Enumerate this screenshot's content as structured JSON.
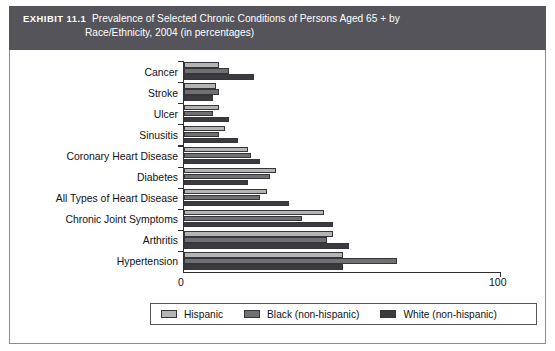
{
  "exhibit": {
    "label": "EXHIBIT 11.1",
    "title_line1": "Prevalence of Selected Chronic Conditions of Persons Aged 65 + by",
    "title_line2": "Race/Ethnicity, 2004 (in percentages)",
    "banner_color": "#55545a"
  },
  "axis": {
    "min_label": "0",
    "max_label": "100",
    "min": 0,
    "max": 100
  },
  "legend": {
    "position": "bottom",
    "entries": [
      {
        "label": "Hispanic",
        "color": "#b4b4b4"
      },
      {
        "label": "Black (non-hispanic)",
        "color": "#6f6f74"
      },
      {
        "label": "White (non-hispanic)",
        "color": "#3a3a40"
      }
    ]
  },
  "chart_data": {
    "type": "bar",
    "orientation": "horizontal",
    "title": "Prevalence of Selected Chronic Conditions of Persons Aged 65 + by Race/Ethnicity, 2004 (in percentages)",
    "xlabel": "",
    "ylabel": "",
    "xlim": [
      0,
      100
    ],
    "grid": false,
    "legend_position": "bottom",
    "categories": [
      "Cancer",
      "Stroke",
      "Ulcer",
      "Sinusitis",
      "Coronary Heart Disease",
      "Diabetes",
      "All Types of Heart Disease",
      "Chronic Joint Symptoms",
      "Arthritis",
      "Hypertension"
    ],
    "series": [
      {
        "name": "Hispanic",
        "color": "#b4b4b4",
        "values": [
          11,
          10,
          11,
          13,
          20,
          29,
          26,
          44,
          47,
          50
        ]
      },
      {
        "name": "Black (non-hispanic)",
        "color": "#6f6f74",
        "values": [
          14,
          11,
          9,
          11,
          21,
          27,
          24,
          37,
          45,
          67
        ]
      },
      {
        "name": "White (non-hispanic)",
        "color": "#3a3a40",
        "values": [
          22,
          9,
          14,
          17,
          24,
          20,
          33,
          47,
          52,
          50
        ]
      }
    ]
  }
}
